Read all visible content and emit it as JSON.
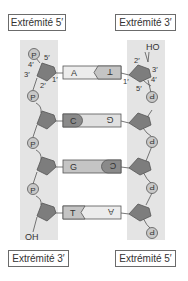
{
  "labels": {
    "top_left": "Extrémité 5′",
    "top_right": "Extrémité 3′",
    "bottom_left": "Extrémité 3′",
    "bottom_right": "Extrémité 5′"
  },
  "carbon_labels_left": {
    "c5": "5′",
    "c4": "4′",
    "c3": "3′",
    "c2": "2′",
    "c1": "1′"
  },
  "carbon_labels_right": {
    "c2": "2′",
    "c3": "3′",
    "c1": "1′",
    "c4": "4′",
    "c5": "5′"
  },
  "terminal_groups": {
    "top_right": "HO",
    "bottom_left": "OH"
  },
  "phosphate_symbol": "P",
  "base_pairs": [
    {
      "left": "A",
      "right": "T",
      "left_shade": "light",
      "right_shade": "mid",
      "joint": "chevron"
    },
    {
      "left": "C",
      "right": "G",
      "left_shade": "dark",
      "right_shade": "light",
      "joint": "round"
    },
    {
      "left": "G",
      "right": "C",
      "left_shade": "mid",
      "right_shade": "dark",
      "joint": "round"
    },
    {
      "left": "T",
      "right": "A",
      "left_shade": "mid",
      "right_shade": "light",
      "joint": "chevron"
    }
  ],
  "colors": {
    "strip": "#e4e4e4",
    "sugar": "#7d7d7d",
    "phosphate": "#c8c8c8",
    "base_light": "#ececec",
    "base_mid": "#c4c4c4",
    "base_dark": "#8a8a8a",
    "line": "#555555"
  }
}
